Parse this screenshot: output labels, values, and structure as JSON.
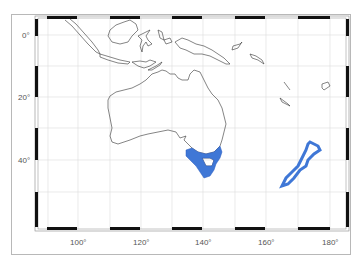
{
  "map": {
    "projection": "Mercator",
    "region": "Australia and New Zealand",
    "lon_range": [
      87,
      185
    ],
    "lat_range": [
      5,
      -57
    ],
    "grid_step_deg": 10,
    "colors": {
      "highlight": "#3f77d6",
      "highlight_stroke": "#2a5dc0",
      "coastline": "#333333",
      "grid": "#dddddd",
      "frame_black": "#111111"
    },
    "highlighted_regions": [
      "Southeastern Australia (Victoria) and Tasmania",
      "New Zealand"
    ]
  },
  "axes": {
    "x_labels": [
      {
        "text": "100°",
        "x": 78
      },
      {
        "text": "120°",
        "x": 141
      },
      {
        "text": "140°",
        "x": 203
      },
      {
        "text": "160°",
        "x": 266
      },
      {
        "text": "180°",
        "x": 330
      }
    ],
    "y_labels": [
      {
        "text": "0°",
        "y": 35
      },
      {
        "text": "20°",
        "y": 97
      },
      {
        "text": "40°",
        "y": 160
      }
    ]
  }
}
